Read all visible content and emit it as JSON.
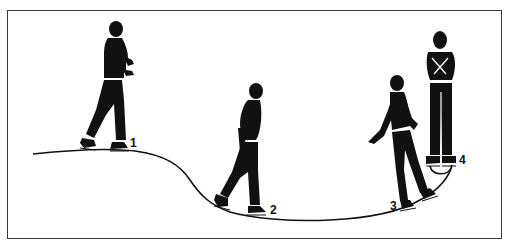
{
  "illustration": {
    "subject": "Figure skating step sequence",
    "colors": {
      "ink": "#111111",
      "paper": "#ffffff",
      "frame": "#3a3a3a"
    },
    "positions": [
      {
        "number": "1",
        "pose": "skating forward, arms bent in front"
      },
      {
        "number": "2",
        "pose": "stepping down the curve, arms at sides"
      },
      {
        "number": "3",
        "pose": "turning, left arm extended back"
      },
      {
        "number": "4",
        "pose": "spinning upright, arms crossed on chest"
      }
    ]
  }
}
